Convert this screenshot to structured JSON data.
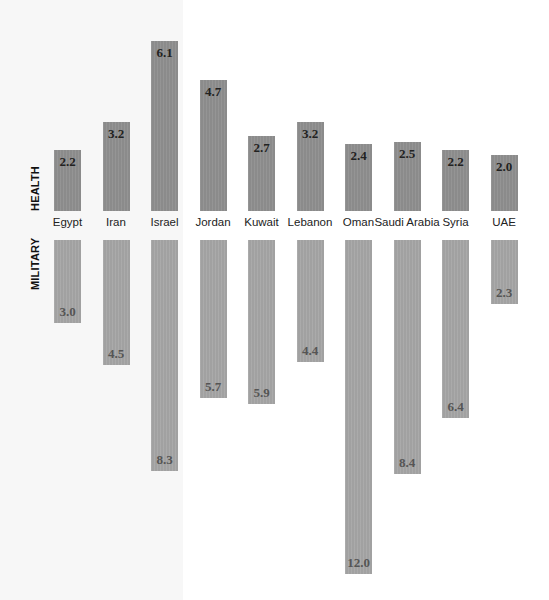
{
  "chart_data": {
    "type": "bar",
    "title": "",
    "categories": [
      "Egypt",
      "Iran",
      "Israel",
      "Jordan",
      "Kuwait",
      "Lebanon",
      "Oman",
      "Saudi Arabia",
      "Syria",
      "UAE"
    ],
    "series": [
      {
        "name": "HEALTH",
        "direction": "up",
        "color": "#8f8f8f",
        "values": [
          2.2,
          3.2,
          6.1,
          4.7,
          2.7,
          3.2,
          2.4,
          2.5,
          2.2,
          2.0
        ]
      },
      {
        "name": "MILITARY",
        "direction": "down",
        "color": "#a6a6a6",
        "values": [
          3.0,
          4.5,
          8.3,
          5.7,
          5.9,
          4.4,
          12.0,
          8.4,
          6.4,
          2.3
        ]
      }
    ],
    "labels": {
      "health": "HEALTH",
      "military": "MILITARY"
    },
    "grid": false,
    "legend": "none",
    "highlight_region": {
      "categories": [
        "Egypt",
        "Iran",
        "Israel"
      ],
      "color": "#f7f7f7"
    }
  }
}
